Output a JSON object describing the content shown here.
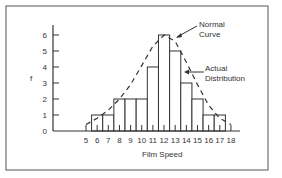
{
  "chart_data": {
    "type": "bar",
    "title": "",
    "xlabel": "Film Speed",
    "ylabel": "f",
    "categories": [
      "5",
      "6",
      "7",
      "8",
      "9",
      "10",
      "11",
      "12",
      "13",
      "14",
      "15",
      "16",
      "17",
      "18"
    ],
    "x_ticks": [
      5,
      6,
      7,
      8,
      9,
      10,
      11,
      12,
      13,
      14,
      15,
      16,
      17,
      18
    ],
    "y_ticks": [
      0,
      1,
      2,
      3,
      4,
      5,
      6
    ],
    "ylim": [
      0,
      6
    ],
    "grid": false,
    "series": [
      {
        "name": "Actual Distribution",
        "type": "histogram",
        "x": [
          6,
          7,
          8,
          9,
          10,
          11,
          12,
          13,
          14,
          15,
          16,
          17
        ],
        "values": [
          1,
          1,
          2,
          2,
          2,
          4,
          6,
          5,
          3,
          2,
          1,
          1
        ]
      },
      {
        "name": "Normal Curve",
        "type": "line",
        "style": "dashed",
        "x": [
          5,
          6,
          7,
          8,
          9,
          10,
          11,
          12,
          13,
          14,
          15,
          16,
          17,
          18
        ],
        "values": [
          0.4,
          0.8,
          1.3,
          2.0,
          2.9,
          4.1,
          5.3,
          6.0,
          5.6,
          4.3,
          2.9,
          1.6,
          0.8,
          0.4
        ]
      }
    ],
    "annotations": [
      {
        "text_lines": [
          "Normal",
          "Curve"
        ],
        "points_to": "Normal Curve"
      },
      {
        "text_lines": [
          "Actual",
          "Distribution"
        ],
        "points_to": "Actual Distribution"
      }
    ]
  },
  "labels": {
    "y_axis": "f",
    "x_axis": "Film Speed",
    "normal_1": "Normal",
    "normal_2": "Curve",
    "actual_1": "Actual",
    "actual_2": "Distribution"
  }
}
